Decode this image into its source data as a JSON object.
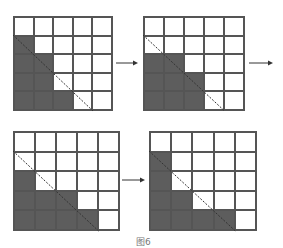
{
  "colors": {
    "filled": "#5d5d5d",
    "empty": "#ffffff",
    "line": "#555555"
  },
  "grids": [
    {
      "name": "step-1",
      "x": 13,
      "y": 16,
      "w": 100,
      "h": 95,
      "rows": 5,
      "cols": 5,
      "filled": [
        [
          0,
          0,
          0,
          0,
          0
        ],
        [
          1,
          0,
          0,
          0,
          0
        ],
        [
          1,
          1,
          0,
          0,
          0
        ],
        [
          1,
          1,
          0,
          0,
          0
        ],
        [
          1,
          1,
          1,
          0,
          0
        ]
      ],
      "diagonal": {
        "from": [
          0,
          1
        ],
        "to": [
          4,
          5
        ]
      }
    },
    {
      "name": "step-2",
      "x": 143,
      "y": 16,
      "w": 102,
      "h": 95,
      "rows": 5,
      "cols": 5,
      "filled": [
        [
          0,
          0,
          0,
          0,
          0
        ],
        [
          0,
          0,
          0,
          0,
          0
        ],
        [
          1,
          1,
          0,
          0,
          0
        ],
        [
          1,
          1,
          1,
          0,
          0
        ],
        [
          1,
          1,
          1,
          0,
          0
        ]
      ],
      "diagonal": {
        "from": [
          0,
          1
        ],
        "to": [
          4,
          5
        ]
      }
    },
    {
      "name": "step-3",
      "x": 13,
      "y": 131,
      "w": 107,
      "h": 100,
      "rows": 5,
      "cols": 5,
      "filled": [
        [
          0,
          0,
          0,
          0,
          0
        ],
        [
          0,
          0,
          0,
          0,
          0
        ],
        [
          1,
          0,
          0,
          0,
          0
        ],
        [
          1,
          1,
          1,
          0,
          0
        ],
        [
          1,
          1,
          1,
          1,
          0
        ]
      ],
      "diagonal": {
        "from": [
          0,
          1
        ],
        "to": [
          4,
          5
        ]
      }
    },
    {
      "name": "step-4",
      "x": 149,
      "y": 131,
      "w": 108,
      "h": 100,
      "rows": 5,
      "cols": 5,
      "filled": [
        [
          0,
          0,
          0,
          0,
          0
        ],
        [
          1,
          0,
          0,
          0,
          0
        ],
        [
          1,
          0,
          0,
          0,
          0
        ],
        [
          1,
          1,
          0,
          0,
          0
        ],
        [
          1,
          1,
          1,
          1,
          0
        ]
      ],
      "diagonal": {
        "from": [
          0,
          1
        ],
        "to": [
          4,
          5
        ]
      }
    }
  ],
  "arrows": [
    {
      "name": "arrow-1-to-2",
      "x1": 116,
      "y1": 63,
      "x2": 138,
      "y2": 63
    },
    {
      "name": "arrow-2-out",
      "x1": 249,
      "y1": 63,
      "x2": 273,
      "y2": 63
    },
    {
      "name": "arrow-3-to-4",
      "x1": 122,
      "y1": 180,
      "x2": 145,
      "y2": 180
    }
  ],
  "caption": {
    "text": "图6",
    "x": 136,
    "y": 235
  }
}
